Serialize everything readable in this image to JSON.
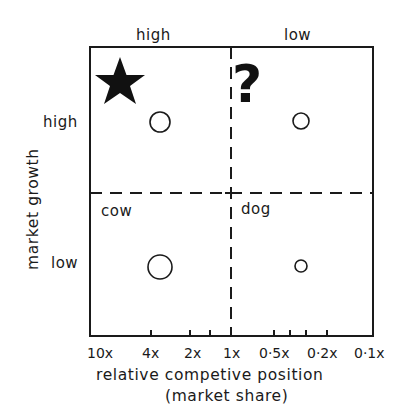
{
  "diagram": {
    "type": "growth-share matrix",
    "column_headers": {
      "left": "high",
      "right": "low"
    },
    "row_headers": {
      "top": "high",
      "bottom": "low"
    },
    "y_axis_title": "market growth",
    "x_axis_title_line1": "relative competive position",
    "x_axis_title_line2": "(market share)",
    "x_ticks": [
      "10x",
      "4x",
      "2x",
      "1x",
      "0·5x",
      "0·2x",
      "0·1x"
    ],
    "quadrants": {
      "top_left": {
        "label": "",
        "icon": "star-icon"
      },
      "top_right": {
        "label": "",
        "icon": "question-mark-icon",
        "glyph": "?"
      },
      "bottom_left": {
        "label": "cow"
      },
      "bottom_right": {
        "label": "dog"
      }
    },
    "bubbles": [
      {
        "quadrant": "top_left",
        "cx": 160,
        "cy": 122,
        "r": 10
      },
      {
        "quadrant": "top_right",
        "cx": 301,
        "cy": 121,
        "r": 8
      },
      {
        "quadrant": "bottom_left",
        "cx": 160,
        "cy": 267,
        "r": 12
      },
      {
        "quadrant": "bottom_right",
        "cx": 301,
        "cy": 266,
        "r": 6
      }
    ],
    "colors": {
      "ink": "#1a1a1a",
      "background": "#ffffff"
    }
  }
}
